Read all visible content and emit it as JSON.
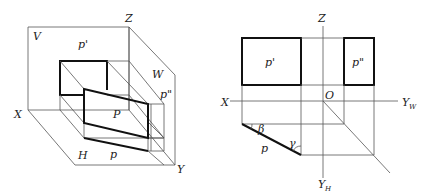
{
  "left_diagram": {
    "title": "3D projection planes",
    "labels": {
      "z": "Z",
      "v": "V",
      "p_prime": "p'",
      "w": "W",
      "p_double_prime": "p\"",
      "x": "X",
      "p_plane": "P",
      "h": "H",
      "p_lower": "p",
      "y": "Y"
    }
  },
  "right_diagram": {
    "title": "Orthographic projections",
    "labels": {
      "z": "Z",
      "p_prime": "p'",
      "p_double_prime": "p\"",
      "x": "X",
      "origin": "O",
      "y_w": "Y",
      "y_w_sub": "W",
      "beta": "β",
      "gamma": "γ",
      "p_lower": "p",
      "y_h": "Y",
      "y_h_sub": "H"
    }
  },
  "colors": {
    "line": "#555555",
    "thick_line": "#111111",
    "background": "#ffffff"
  }
}
